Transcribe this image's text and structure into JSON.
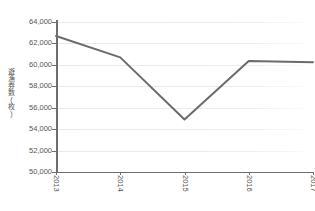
{
  "chart_data": {
    "type": "line",
    "title": "",
    "subtitle": "",
    "xlabel": "",
    "ylabel": "遊漁券数(枚)",
    "categories": [
      "2013",
      "2014",
      "2015",
      "2016",
      "2017"
    ],
    "x": [
      2013,
      2014,
      2015,
      2016,
      2017
    ],
    "values": [
      62700,
      60700,
      54900,
      60350,
      60250
    ],
    "series": [
      {
        "name": "遊漁券数(枚)",
        "values": [
          62700,
          60700,
          54900,
          60350,
          60250
        ],
        "color": "#6b6b6b"
      }
    ],
    "ylim": [
      50000,
      64000
    ],
    "ytick_step": 2000,
    "ytick_labels": [
      "64,000",
      "62,000",
      "60,000",
      "58,000",
      "56,000",
      "54,000",
      "52,000",
      "50,000"
    ],
    "ytick_values": [
      64000,
      62000,
      60000,
      58000,
      56000,
      54000,
      52000,
      50000
    ],
    "xtick_labels": [
      "2013",
      "2014",
      "2015",
      "2016",
      "2017"
    ],
    "xtick_rotation": 90,
    "grid": {
      "horizontal": true,
      "vertical": false,
      "color": "#ececec"
    },
    "legend": {
      "visible": false,
      "position": "none"
    },
    "axis_color": "#6e6e6e",
    "background_color": "#ffffff",
    "line_width": 2.0,
    "markers": false
  }
}
